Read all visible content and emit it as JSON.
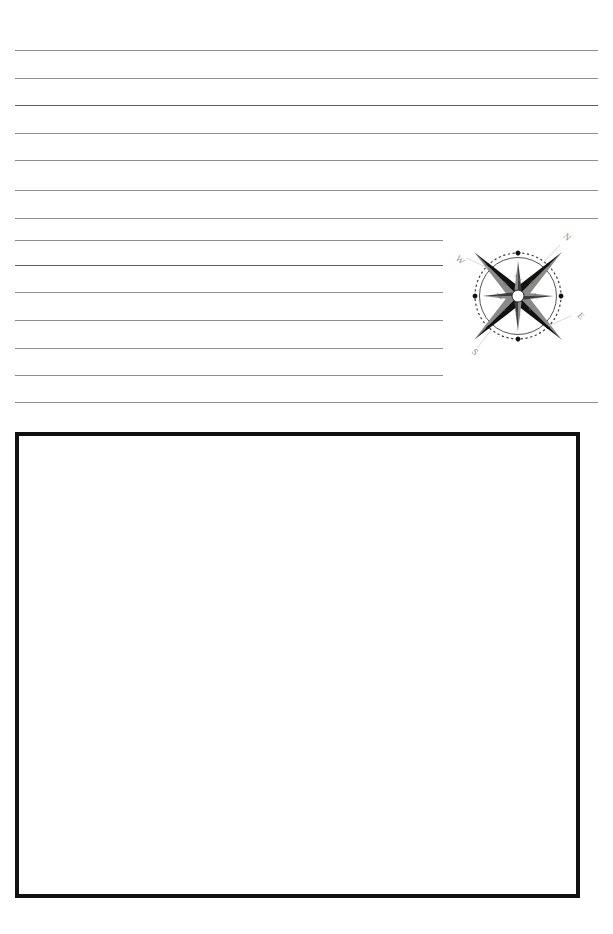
{
  "page": {
    "background_color": "#ffffff",
    "width": 613,
    "height": 934
  },
  "ruled_area": {
    "name": "writing-lines",
    "line_color": "#8d8d92",
    "line_count": 13,
    "left_margin": 15,
    "right_margin": 598,
    "short_line_end": 443,
    "lines": [
      {
        "y": 50,
        "x_start": 15,
        "x_end": 598,
        "truncated": false,
        "dark": false
      },
      {
        "y": 78,
        "x_start": 15,
        "x_end": 598,
        "truncated": false,
        "dark": false
      },
      {
        "y": 105,
        "x_start": 15,
        "x_end": 598,
        "truncated": false,
        "dark": true
      },
      {
        "y": 133,
        "x_start": 15,
        "x_end": 598,
        "truncated": false,
        "dark": false
      },
      {
        "y": 160,
        "x_start": 15,
        "x_end": 598,
        "truncated": false,
        "dark": false
      },
      {
        "y": 190,
        "x_start": 15,
        "x_end": 598,
        "truncated": false,
        "dark": false
      },
      {
        "y": 218,
        "x_start": 15,
        "x_end": 598,
        "truncated": false,
        "dark": false
      },
      {
        "y": 240,
        "x_start": 15,
        "x_end": 443,
        "truncated": true,
        "dark": false
      },
      {
        "y": 265,
        "x_start": 15,
        "x_end": 443,
        "truncated": true,
        "dark": true
      },
      {
        "y": 292,
        "x_start": 15,
        "x_end": 443,
        "truncated": true,
        "dark": false
      },
      {
        "y": 320,
        "x_start": 15,
        "x_end": 443,
        "truncated": true,
        "dark": false
      },
      {
        "y": 348,
        "x_start": 15,
        "x_end": 443,
        "truncated": true,
        "dark": false
      },
      {
        "y": 375,
        "x_start": 15,
        "x_end": 443,
        "truncated": true,
        "dark": false
      },
      {
        "y": 402,
        "x_start": 15,
        "x_end": 598,
        "truncated": false,
        "dark": false
      }
    ]
  },
  "compass_rose": {
    "name": "compass-rose",
    "description": "Eight-point compass star with dotted bearing ring, rotated clockwise about 45 degrees",
    "rotation_degrees": 45,
    "center_x": 518,
    "center_y": 296,
    "star_color_dark": "#111111",
    "star_color_light": "#8a8a8a",
    "ring_color": "#3a3a3a",
    "label_color": "#7a7a7a",
    "cardinal_labels": [
      {
        "key": "north",
        "text": "N"
      },
      {
        "key": "east",
        "text": "E"
      },
      {
        "key": "south",
        "text": "S"
      },
      {
        "key": "west",
        "text": "W"
      }
    ],
    "intercardinal_marks": 8
  },
  "answer_box": {
    "name": "answer-box",
    "label": "",
    "content": "",
    "border_color": "#111111",
    "border_width": 4,
    "fill_color": "#ffffff",
    "x": 15,
    "y": 432,
    "width": 565,
    "height": 466
  }
}
